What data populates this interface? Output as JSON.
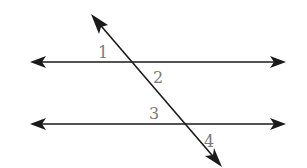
{
  "diagram": {
    "colors": {
      "line": "#1a1a1a",
      "label": "#7a7a7a",
      "background": "#ffffff"
    },
    "lines": [
      {
        "id": "upper-parallel",
        "x1": 30,
        "y1": 62,
        "x2": 286,
        "y2": 62,
        "arrows": "both"
      },
      {
        "id": "lower-parallel",
        "x1": 30,
        "y1": 124,
        "x2": 286,
        "y2": 124,
        "arrows": "both"
      },
      {
        "id": "transversal",
        "x1": 91,
        "y1": 14,
        "x2": 222,
        "y2": 167,
        "arrows": "both"
      }
    ],
    "angle_labels": [
      {
        "text": "1",
        "x": 98,
        "y": 58
      },
      {
        "text": "2",
        "x": 153,
        "y": 83
      },
      {
        "text": "3",
        "x": 149,
        "y": 119
      },
      {
        "text": "4",
        "x": 204,
        "y": 147
      }
    ]
  }
}
